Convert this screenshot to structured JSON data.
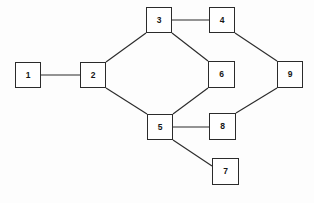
{
  "diagram": {
    "type": "undirected-node-link-graph",
    "canvas": {
      "width": 314,
      "height": 203,
      "background": "#fdfdfd"
    },
    "style": {
      "node_fill": "#ffffff",
      "node_stroke": "#2b2b2b",
      "edge_stroke": "#2b2b2b",
      "label_color": "#161616"
    },
    "nodes": [
      {
        "id": "1",
        "label": "1",
        "x": 15,
        "y": 62,
        "w": 26,
        "h": 26
      },
      {
        "id": "2",
        "label": "2",
        "x": 80,
        "y": 62,
        "w": 26,
        "h": 26
      },
      {
        "id": "3",
        "label": "3",
        "x": 146,
        "y": 7,
        "w": 26,
        "h": 26
      },
      {
        "id": "4",
        "label": "4",
        "x": 209,
        "y": 7,
        "w": 26,
        "h": 26
      },
      {
        "id": "5",
        "label": "5",
        "x": 147,
        "y": 114,
        "w": 26,
        "h": 26
      },
      {
        "id": "6",
        "label": "6",
        "x": 208,
        "y": 61,
        "w": 27,
        "h": 27
      },
      {
        "id": "7",
        "label": "7",
        "x": 212,
        "y": 158,
        "w": 27,
        "h": 27
      },
      {
        "id": "8",
        "label": "8",
        "x": 209,
        "y": 113,
        "w": 27,
        "h": 27
      },
      {
        "id": "9",
        "label": "9",
        "x": 277,
        "y": 61,
        "w": 26,
        "h": 27
      }
    ],
    "edges": [
      {
        "id": "e-1-2",
        "from": "1",
        "to": "2",
        "x1": 41,
        "y1": 75,
        "x2": 80,
        "y2": 75
      },
      {
        "id": "e-2-3",
        "from": "2",
        "to": "3",
        "x1": 106,
        "y1": 62,
        "x2": 146,
        "y2": 33
      },
      {
        "id": "e-2-5",
        "from": "2",
        "to": "5",
        "x1": 106,
        "y1": 88,
        "x2": 147,
        "y2": 114
      },
      {
        "id": "e-3-4",
        "from": "3",
        "to": "4",
        "x1": 172,
        "y1": 20,
        "x2": 209,
        "y2": 20
      },
      {
        "id": "e-3-6",
        "from": "3",
        "to": "6",
        "x1": 172,
        "y1": 33,
        "x2": 208,
        "y2": 61
      },
      {
        "id": "e-4-9",
        "from": "4",
        "to": "9",
        "x1": 235,
        "y1": 33,
        "x2": 277,
        "y2": 61
      },
      {
        "id": "e-5-6",
        "from": "5",
        "to": "6",
        "x1": 173,
        "y1": 114,
        "x2": 208,
        "y2": 88
      },
      {
        "id": "e-5-8",
        "from": "5",
        "to": "8",
        "x1": 173,
        "y1": 127,
        "x2": 209,
        "y2": 127
      },
      {
        "id": "e-5-7",
        "from": "5",
        "to": "7",
        "x1": 173,
        "y1": 140,
        "x2": 212,
        "y2": 166
      },
      {
        "id": "e-8-9",
        "from": "8",
        "to": "9",
        "x1": 236,
        "y1": 113,
        "x2": 277,
        "y2": 88
      }
    ]
  }
}
